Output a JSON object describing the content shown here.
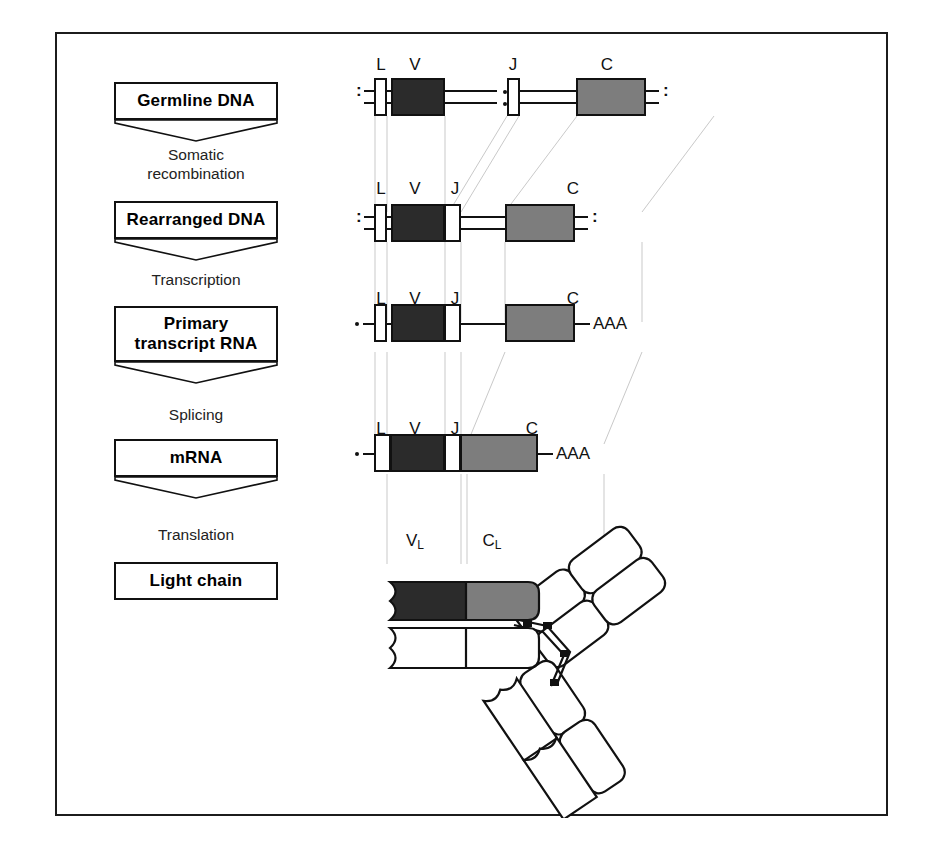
{
  "figure": {
    "colors": {
      "frame": "#1c1c1c",
      "v_segment": "#2b2b2b",
      "c_segment": "#7d7d7d",
      "l_segment": "#ffffff",
      "j_segment": "#ffffff",
      "guide_line": "#c8c8c8",
      "outline": "#111111"
    }
  },
  "stages": [
    {
      "id": "germline-dna",
      "label": "Germline  DNA",
      "has_chevron": true
    },
    {
      "id": "rearranged-dna",
      "label": "Rearranged DNA",
      "has_chevron": true
    },
    {
      "id": "primary-rna",
      "label": "Primary\ntranscript  RNA",
      "has_chevron": true
    },
    {
      "id": "mrna",
      "label": "mRNA",
      "has_chevron": true
    },
    {
      "id": "light-chain",
      "label": "Light  chain",
      "has_chevron": false
    }
  ],
  "processes": [
    {
      "id": "somatic-recombination",
      "label": "Somatic\nrecombination"
    },
    {
      "id": "transcription",
      "label": "Transcription"
    },
    {
      "id": "splicing",
      "label": "Splicing"
    },
    {
      "id": "translation",
      "label": "Translation"
    }
  ],
  "rows": {
    "germline_dna": {
      "name": "Germline DNA",
      "strand_type": "double",
      "left_end": ":",
      "right_end": ":",
      "has_gap_break": true,
      "segment_labels": [
        "L",
        "V",
        "J",
        "C"
      ]
    },
    "rearranged_dna": {
      "name": "Rearranged DNA",
      "strand_type": "double",
      "left_end": ":",
      "right_end": ":",
      "has_gap_break": false,
      "segment_labels": [
        "L",
        "V",
        "J",
        "C"
      ]
    },
    "primary_transcript_rna": {
      "name": "Primary transcript RNA",
      "strand_type": "single",
      "left_end": "·",
      "right_end": "AAA",
      "segment_labels": [
        "L",
        "V",
        "J",
        "C"
      ]
    },
    "mrna": {
      "name": "mRNA",
      "strand_type": "single",
      "left_end": "·",
      "right_end": "AAA",
      "contiguous": true,
      "segment_labels": [
        "L",
        "V",
        "J",
        "C"
      ]
    }
  },
  "protein": {
    "domain_labels": [
      "V",
      "C"
    ],
    "domain_subscripts": [
      "L",
      "L"
    ],
    "v_label_full": "VL",
    "c_label_full": "CL",
    "description": "Antibody molecule: two light chains and two heavy chains forming a Y shape"
  }
}
